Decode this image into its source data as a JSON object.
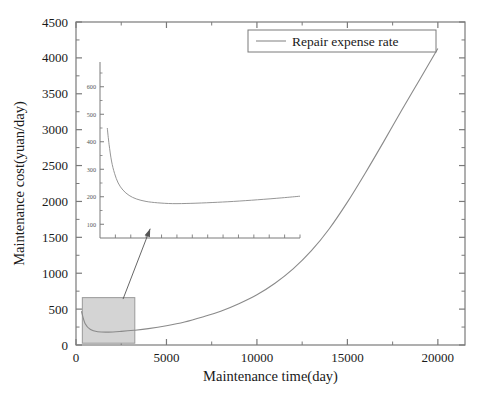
{
  "figure": {
    "name": "maintenance-cost-chart",
    "background": "#ffffff",
    "line_color": "#8a8a8a",
    "axis_color": "#7a7a7a",
    "text_color": "#1a1a1a",
    "highlight_fill": "#d4d4d4",
    "highlight_stroke": "#9a9a9a"
  },
  "chart_data": {
    "type": "line",
    "title": "",
    "xlabel": "Maintenance time(day)",
    "ylabel": "Maintenance cost(yuan/day)",
    "xlim": [
      0,
      21500
    ],
    "ylim": [
      0,
      4500
    ],
    "xticks": [
      0,
      5000,
      10000,
      15000,
      20000
    ],
    "xtick_labels": [
      "0",
      "5000",
      "10000",
      "15000",
      "20000"
    ],
    "yticks": [
      0,
      500,
      1000,
      1500,
      2000,
      2500,
      3000,
      3500,
      4000,
      4500
    ],
    "ytick_labels": [
      "0",
      "500",
      "1000",
      "1500",
      "2000",
      "2500",
      "3000",
      "3500",
      "4000",
      "4500"
    ],
    "minor_ticks": true,
    "grid": false,
    "legend": {
      "position": "top-right",
      "entries": [
        "Repair expense rate"
      ]
    },
    "series": [
      {
        "name": "Repair expense rate",
        "color": "#8a8a8a",
        "x": [
          300,
          500,
          800,
          1200,
          1800,
          2500,
          3200,
          4000,
          5000,
          6000,
          7000,
          8000,
          9000,
          10000,
          11000,
          12000,
          13000,
          14000,
          15000,
          16000,
          17000,
          18000,
          19000,
          20000
        ],
        "y": [
          470,
          300,
          215,
          185,
          180,
          190,
          205,
          228,
          268,
          320,
          390,
          470,
          575,
          700,
          860,
          1060,
          1310,
          1620,
          1990,
          2400,
          2830,
          3270,
          3700,
          4130
        ]
      }
    ],
    "annotations": [
      {
        "type": "highlight-rectangle",
        "name": "zoom-region-rectangle",
        "x_range": [
          350,
          3250
        ],
        "y_range": [
          25,
          660
        ],
        "fill": "#d4d4d4"
      },
      {
        "type": "arrow",
        "name": "zoom-connector-arrow",
        "from": [
          2600,
          640
        ],
        "to": [
          4100,
          1620
        ]
      }
    ],
    "inset": {
      "name": "inset-detail-plot",
      "type": "line",
      "description": "Magnified view of early maintenance period",
      "xlim": [
        0,
        3300
      ],
      "ylim": [
        50,
        690
      ],
      "yticks": [
        100,
        200,
        300,
        400,
        500,
        600
      ],
      "ytick_labels": [
        "100",
        "200",
        "300",
        "400",
        "500",
        "600"
      ],
      "xtick_labels": [],
      "minor_ticks": true,
      "series": [
        {
          "name": "Repair expense rate",
          "color": "#8a8a8a",
          "x": [
            120,
            150,
            190,
            240,
            300,
            380,
            480,
            600,
            760,
            950,
            1200,
            1500,
            1850,
            2200,
            2600,
            3000,
            3300
          ],
          "y": [
            450,
            390,
            330,
            285,
            250,
            224,
            205,
            192,
            183,
            178,
            175,
            176,
            179,
            183,
            189,
            196,
            202
          ]
        }
      ]
    }
  }
}
